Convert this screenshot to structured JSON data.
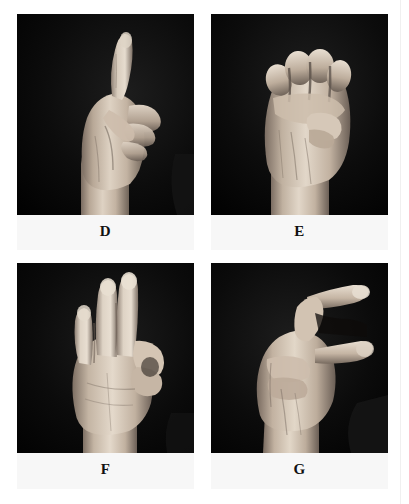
{
  "page": {
    "background_color": "#ffffff",
    "photo_background_color": "#050505",
    "caption_background_color": "#f7f7f7",
    "caption_text_color": "#111111",
    "skin_highlight_color": "#e8ded2",
    "skin_mid_color": "#bfb0a0",
    "skin_shadow_color": "#6d6158",
    "rule_color": "#f0f0f0"
  },
  "figure": {
    "layout": "2x2-grid",
    "panels": [
      {
        "id": "panel-d",
        "caption": "D",
        "row": 0,
        "column": 0,
        "image_alt": "Hand forming ASL letter D: index finger extended upward, thumb touching tips of curled middle, ring and little fingers",
        "sign_description": "index-finger-up-thumb-to-middle"
      },
      {
        "id": "panel-e",
        "caption": "E",
        "row": 0,
        "column": 1,
        "image_alt": "Hand forming ASL letter E: all four fingers curled down onto the thumb, forming a closed fist shape",
        "sign_description": "fingers-curled-over-thumb"
      },
      {
        "id": "panel-f",
        "caption": "F",
        "row": 1,
        "column": 0,
        "image_alt": "Hand forming ASL letter F: middle, ring and little fingers extended upward while thumb and index finger touch in a circle",
        "sign_description": "three-fingers-up-thumb-index-circle"
      },
      {
        "id": "panel-g",
        "caption": "G",
        "row": 1,
        "column": 1,
        "image_alt": "Hand forming ASL letter G: index finger and thumb extended horizontally and held parallel, other fingers curled",
        "sign_description": "index-and-thumb-horizontal-parallel"
      }
    ]
  }
}
